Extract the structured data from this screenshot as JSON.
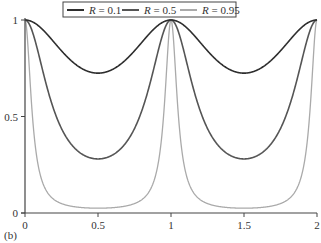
{
  "chart_data": {
    "type": "line",
    "title": "",
    "panel_label": "(b)",
    "xlabel": "",
    "ylabel": "",
    "xlim": [
      0,
      2
    ],
    "ylim": [
      0,
      1
    ],
    "x_ticks": [
      0,
      0.5,
      1,
      1.5,
      2
    ],
    "x_tick_labels": [
      "0",
      "0.5",
      "1",
      "1.5",
      "2"
    ],
    "y_ticks": [
      0,
      0.5,
      1
    ],
    "y_tick_labels": [
      "0",
      "0.5",
      "1"
    ],
    "grid": false,
    "legend_position": "top-center",
    "periodic_period": 1,
    "x": [
      0,
      0.05,
      0.1,
      0.15,
      0.2,
      0.25,
      0.3,
      0.35,
      0.4,
      0.45,
      0.5,
      0.55,
      0.6,
      0.65,
      0.7,
      0.75,
      0.8,
      0.85,
      0.9,
      0.95,
      1.0,
      1.05,
      1.1,
      1.15,
      1.2,
      1.25,
      1.3,
      1.35,
      1.4,
      1.45,
      1.5,
      1.55,
      1.6,
      1.65,
      1.7,
      1.75,
      1.8,
      1.85,
      1.9,
      1.95,
      2.0
    ],
    "series": [
      {
        "name": "R = 0.1",
        "legend_var": "R",
        "legend_value": "0.1",
        "color": "#2e2e2e",
        "width": 1.6,
        "F": 0.38,
        "min_value": 0.725,
        "values": [
          1,
          0.991,
          0.965,
          0.927,
          0.884,
          0.84,
          0.801,
          0.768,
          0.744,
          0.73,
          0.725,
          0.73,
          0.744,
          0.768,
          0.801,
          0.84,
          0.884,
          0.927,
          0.965,
          0.991,
          1,
          0.991,
          0.965,
          0.927,
          0.884,
          0.84,
          0.801,
          0.768,
          0.744,
          0.73,
          0.725,
          0.73,
          0.744,
          0.768,
          0.801,
          0.84,
          0.884,
          0.927,
          0.965,
          0.991,
          1
        ]
      },
      {
        "name": "R = 0.5",
        "legend_var": "R",
        "legend_value": "0.5",
        "color": "#555555",
        "width": 1.6,
        "F": 2.57,
        "min_value": 0.28,
        "values": [
          1,
          0.941,
          0.803,
          0.654,
          0.53,
          0.438,
          0.373,
          0.329,
          0.301,
          0.285,
          0.28,
          0.285,
          0.301,
          0.329,
          0.373,
          0.438,
          0.53,
          0.654,
          0.803,
          0.941,
          1,
          0.941,
          0.803,
          0.654,
          0.53,
          0.438,
          0.373,
          0.329,
          0.301,
          0.285,
          0.28,
          0.285,
          0.301,
          0.329,
          0.373,
          0.438,
          0.53,
          0.654,
          0.803,
          0.941,
          1
        ]
      },
      {
        "name": "R = 0.95",
        "legend_var": "R",
        "legend_value": "0.95",
        "color": "#aaaaaa",
        "width": 1.3,
        "F": 39,
        "min_value": 0.025,
        "values": [
          1,
          0.511,
          0.212,
          0.111,
          0.069,
          0.049,
          0.038,
          0.031,
          0.028,
          0.026,
          0.025,
          0.026,
          0.028,
          0.031,
          0.038,
          0.049,
          0.069,
          0.111,
          0.212,
          0.511,
          1,
          0.511,
          0.212,
          0.111,
          0.069,
          0.049,
          0.038,
          0.031,
          0.028,
          0.026,
          0.025,
          0.026,
          0.028,
          0.031,
          0.038,
          0.049,
          0.069,
          0.111,
          0.212,
          0.511,
          1
        ]
      }
    ]
  },
  "layout": {
    "plot_left": 25,
    "plot_right": 317,
    "plot_top": 20,
    "plot_bottom": 213,
    "axis_color": "#444444"
  }
}
